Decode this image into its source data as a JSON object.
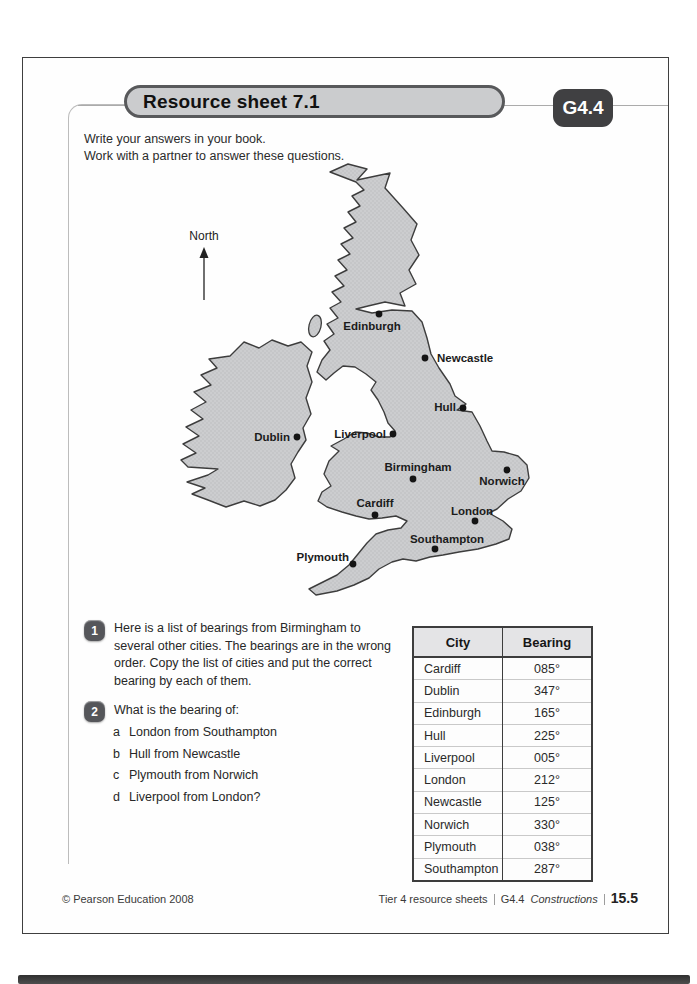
{
  "page": {
    "title": "Resource sheet 7.1",
    "unit_code": "G4.4",
    "intro_lines": [
      "Write your answers in your book.",
      "Work with a partner to answer these questions."
    ]
  },
  "map": {
    "north_label": "North",
    "cities": [
      {
        "name": "Edinburgh",
        "dot": [
          219,
          154
        ],
        "label": [
          212,
          170
        ],
        "anchor": "middle"
      },
      {
        "name": "Newcastle",
        "dot": [
          265,
          198
        ],
        "label": [
          277,
          202
        ],
        "anchor": "start"
      },
      {
        "name": "Hull",
        "dot": [
          303,
          248
        ],
        "label": [
          296,
          251
        ],
        "anchor": "end"
      },
      {
        "name": "Dublin",
        "dot": [
          137,
          277
        ],
        "label": [
          130,
          281
        ],
        "anchor": "end"
      },
      {
        "name": "Liverpool",
        "dot": [
          233,
          274
        ],
        "label": [
          226,
          278
        ],
        "anchor": "end"
      },
      {
        "name": "Birmingham",
        "dot": [
          253,
          319
        ],
        "label": [
          258,
          311
        ],
        "anchor": "middle"
      },
      {
        "name": "Norwich",
        "dot": [
          347,
          310
        ],
        "label": [
          342,
          325
        ],
        "anchor": "middle"
      },
      {
        "name": "Cardiff",
        "dot": [
          215,
          355
        ],
        "label": [
          215,
          347
        ],
        "anchor": "middle"
      },
      {
        "name": "London",
        "dot": [
          315,
          361
        ],
        "label": [
          312,
          355
        ],
        "anchor": "middle"
      },
      {
        "name": "Southampton",
        "dot": [
          275,
          389
        ],
        "label": [
          287,
          383
        ],
        "anchor": "middle"
      },
      {
        "name": "Plymouth",
        "dot": [
          193,
          404
        ],
        "label": [
          189,
          401
        ],
        "anchor": "end"
      }
    ]
  },
  "questions": {
    "q1": {
      "number": "1",
      "text": "Here is a list of bearings from Birmingham to\nseveral other cities. The bearings are in the wrong\norder. Copy the list of cities and put the correct\nbearing by each of them."
    },
    "q2": {
      "number": "2",
      "text": "What is the bearing of:",
      "items": [
        {
          "letter": "a",
          "text": "London from Southampton"
        },
        {
          "letter": "b",
          "text": "Hull from Newcastle"
        },
        {
          "letter": "c",
          "text": "Plymouth from Norwich"
        },
        {
          "letter": "d",
          "text": "Liverpool from London?"
        }
      ]
    }
  },
  "table": {
    "headers": [
      "City",
      "Bearing"
    ],
    "rows": [
      {
        "city": "Cardiff",
        "bearing": "085°"
      },
      {
        "city": "Dublin",
        "bearing": "347°"
      },
      {
        "city": "Edinburgh",
        "bearing": "165°"
      },
      {
        "city": "Hull",
        "bearing": "225°"
      },
      {
        "city": "Liverpool",
        "bearing": "005°"
      },
      {
        "city": "London",
        "bearing": "212°"
      },
      {
        "city": "Newcastle",
        "bearing": "125°"
      },
      {
        "city": "Norwich",
        "bearing": "330°"
      },
      {
        "city": "Plymouth",
        "bearing": "038°"
      },
      {
        "city": "Southampton",
        "bearing": "287°"
      }
    ]
  },
  "footer": {
    "copyright": "© Pearson Education 2008",
    "series": "Tier 4 resource sheets",
    "unit_code": "G4.4",
    "unit_name": "Constructions",
    "page_number": "15.5"
  },
  "colors": {
    "map_fill": "#cbccce",
    "map_stroke": "#3d3d3d",
    "badge_bg": "#404042",
    "pill_bg": "#cbccce",
    "pill_border": "#58595b"
  }
}
